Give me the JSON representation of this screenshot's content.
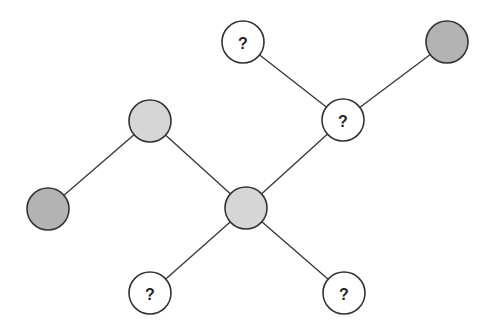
{
  "diagram": {
    "title": "",
    "colors": {
      "unknown_fill": "#ffffff",
      "light_fill": "#d6d6d6",
      "dark_fill": "#b3b3b3",
      "stroke": "#333333"
    },
    "node_radius": 21,
    "nodes": [
      {
        "id": "n_top_q",
        "x": 243,
        "y": 42,
        "type": "unknown",
        "label": "?"
      },
      {
        "id": "n_topright_dark",
        "x": 447,
        "y": 42,
        "type": "dark",
        "label": ""
      },
      {
        "id": "n_midright_q",
        "x": 343,
        "y": 120,
        "type": "unknown",
        "label": "?"
      },
      {
        "id": "n_upperleft_light",
        "x": 150,
        "y": 121,
        "type": "light",
        "label": ""
      },
      {
        "id": "n_left_dark",
        "x": 48,
        "y": 209,
        "type": "dark",
        "label": ""
      },
      {
        "id": "n_center_light",
        "x": 246,
        "y": 208,
        "type": "light",
        "label": ""
      },
      {
        "id": "n_bottomleft_q",
        "x": 150,
        "y": 293,
        "type": "unknown",
        "label": "?"
      },
      {
        "id": "n_bottomright_q",
        "x": 344,
        "y": 293,
        "type": "unknown",
        "label": "?"
      }
    ],
    "edges": [
      {
        "from": "n_top_q",
        "to": "n_midright_q"
      },
      {
        "from": "n_topright_dark",
        "to": "n_midright_q"
      },
      {
        "from": "n_midright_q",
        "to": "n_center_light"
      },
      {
        "from": "n_upperleft_light",
        "to": "n_center_light"
      },
      {
        "from": "n_upperleft_light",
        "to": "n_left_dark"
      },
      {
        "from": "n_center_light",
        "to": "n_bottomleft_q"
      },
      {
        "from": "n_center_light",
        "to": "n_bottomright_q"
      }
    ]
  }
}
